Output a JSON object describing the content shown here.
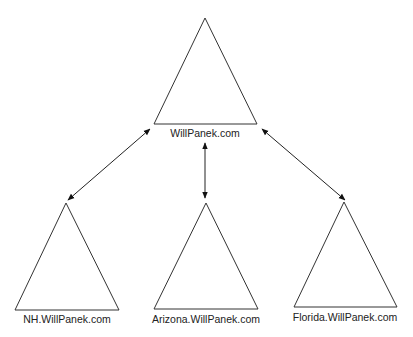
{
  "diagram": {
    "type": "domain-tree",
    "colors": {
      "stroke": "#333333",
      "text": "#222222",
      "background": "#ffffff"
    },
    "root": {
      "label": "WillPanek.com"
    },
    "children": [
      {
        "label": "NH.WillPanek.com"
      },
      {
        "label": "Arizona.WillPanek.com"
      },
      {
        "label": "Florida.WillPanek.com"
      }
    ],
    "connections": [
      {
        "from": "WillPanek.com",
        "to": "NH.WillPanek.com",
        "style": "double-arrow"
      },
      {
        "from": "WillPanek.com",
        "to": "Arizona.WillPanek.com",
        "style": "double-arrow"
      },
      {
        "from": "WillPanek.com",
        "to": "Florida.WillPanek.com",
        "style": "double-arrow"
      }
    ]
  }
}
